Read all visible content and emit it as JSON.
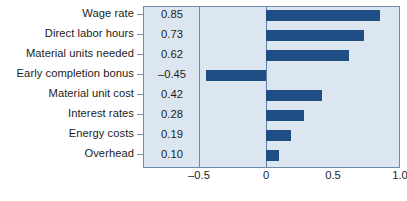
{
  "chart_data": {
    "type": "bar",
    "orientation": "horizontal",
    "title": "",
    "subtitle": "",
    "xlabel": "",
    "ylabel": "",
    "categories": [
      "Wage rate",
      "Direct labor hours",
      "Material units needed",
      "Early completion bonus",
      "Material unit cost",
      "Interest rates",
      "Energy costs",
      "Overhead"
    ],
    "values": [
      0.85,
      0.73,
      0.62,
      -0.45,
      0.42,
      0.28,
      0.19,
      0.1
    ],
    "value_labels": [
      "0.85",
      "0.73",
      "0.62",
      "–0.45",
      "0.42",
      "0.28",
      "0.19",
      "0.10"
    ],
    "xlim": [
      -0.8,
      1.05
    ],
    "xticks": [
      -0.5,
      0,
      0.5,
      1.0
    ],
    "xtick_labels": [
      "–0.5",
      "0",
      "0.5",
      "1.0"
    ],
    "grid": false,
    "legend": null,
    "zero_line": 0,
    "colors": {
      "bar": "#1f4e85",
      "panel_background": "#dce6f1",
      "panel_border": "#6d8aa8",
      "zero_line": "#5b7fa6",
      "text": "#1c1c1c",
      "tick_mark": "#7f93ae",
      "page_background": "#ffffff"
    }
  }
}
